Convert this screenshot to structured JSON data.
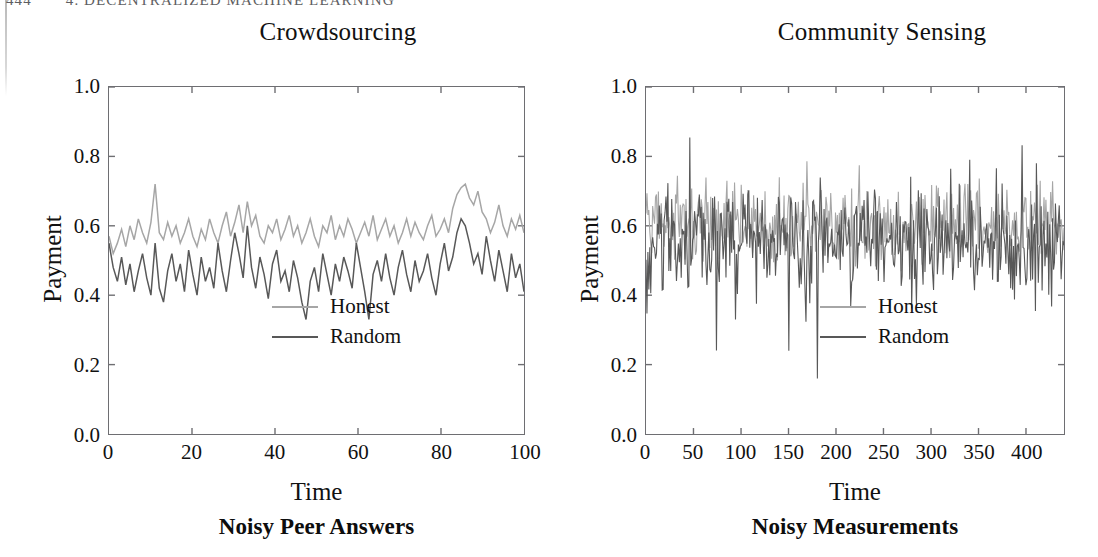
{
  "page": {
    "running_header": {
      "page_number": "444",
      "text": "4. DECENTRALIZED MACHINE LEARNING"
    }
  },
  "colors": {
    "honest": "#a6a6a6",
    "random": "#585858",
    "axis": "#6e6e72",
    "text": "#111111",
    "header": "#5e5e62"
  },
  "panels": [
    {
      "title": "Crowdsourcing",
      "caption": "Noisy Peer Answers",
      "legend": [
        {
          "label": "Honest",
          "color": "#a6a6a6"
        },
        {
          "label": "Random",
          "color": "#585858"
        }
      ]
    },
    {
      "title": "Community Sensing",
      "caption": "Noisy Measurements",
      "legend": [
        {
          "label": "Honest",
          "color": "#a6a6a6"
        },
        {
          "label": "Random",
          "color": "#585858"
        }
      ]
    }
  ],
  "chart_data": [
    {
      "type": "line",
      "title": "Crowdsourcing",
      "caption": "Noisy Peer Answers",
      "xlabel": "Time",
      "ylabel": "Payment",
      "xlim": [
        0,
        100
      ],
      "ylim": [
        0.0,
        1.0
      ],
      "xticks": [
        0,
        20,
        40,
        60,
        80,
        100
      ],
      "xtick_labels": [
        "0",
        "20",
        "40",
        "60",
        "80",
        "100"
      ],
      "yticks": [
        0.0,
        0.2,
        0.4,
        0.6,
        0.8,
        1.0
      ],
      "ytick_labels": [
        "0.0",
        "0.2",
        "0.4",
        "0.6",
        "0.8",
        "1.0"
      ],
      "grid": false,
      "legend_position": "lower right",
      "n_points": 100,
      "series": [
        {
          "name": "Honest",
          "color": "#a6a6a6",
          "mean": 0.575,
          "std": 0.055,
          "values": [
            0.57,
            0.52,
            0.55,
            0.59,
            0.54,
            0.6,
            0.56,
            0.62,
            0.58,
            0.55,
            0.61,
            0.72,
            0.58,
            0.56,
            0.61,
            0.57,
            0.6,
            0.55,
            0.58,
            0.62,
            0.57,
            0.54,
            0.59,
            0.56,
            0.62,
            0.58,
            0.55,
            0.6,
            0.64,
            0.57,
            0.61,
            0.66,
            0.58,
            0.67,
            0.6,
            0.63,
            0.57,
            0.55,
            0.6,
            0.58,
            0.62,
            0.56,
            0.59,
            0.63,
            0.57,
            0.6,
            0.55,
            0.58,
            0.62,
            0.57,
            0.54,
            0.6,
            0.58,
            0.63,
            0.56,
            0.6,
            0.57,
            0.62,
            0.59,
            0.55,
            0.58,
            0.61,
            0.57,
            0.63,
            0.56,
            0.59,
            0.62,
            0.57,
            0.6,
            0.55,
            0.58,
            0.62,
            0.57,
            0.61,
            0.58,
            0.56,
            0.6,
            0.63,
            0.57,
            0.59,
            0.62,
            0.58,
            0.65,
            0.69,
            0.71,
            0.72,
            0.68,
            0.66,
            0.7,
            0.64,
            0.62,
            0.58,
            0.61,
            0.66,
            0.6,
            0.57,
            0.62,
            0.59,
            0.63,
            0.58
          ]
        },
        {
          "name": "Random",
          "color": "#585858",
          "mean": 0.49,
          "std": 0.075,
          "values": [
            0.55,
            0.48,
            0.44,
            0.51,
            0.43,
            0.49,
            0.41,
            0.47,
            0.52,
            0.45,
            0.4,
            0.55,
            0.42,
            0.38,
            0.47,
            0.52,
            0.44,
            0.49,
            0.41,
            0.53,
            0.46,
            0.4,
            0.51,
            0.44,
            0.48,
            0.42,
            0.55,
            0.47,
            0.41,
            0.5,
            0.58,
            0.52,
            0.45,
            0.6,
            0.48,
            0.42,
            0.51,
            0.46,
            0.39,
            0.49,
            0.53,
            0.44,
            0.47,
            0.41,
            0.5,
            0.45,
            0.38,
            0.33,
            0.44,
            0.48,
            0.41,
            0.52,
            0.46,
            0.4,
            0.49,
            0.44,
            0.51,
            0.47,
            0.42,
            0.55,
            0.48,
            0.41,
            0.33,
            0.46,
            0.5,
            0.44,
            0.52,
            0.45,
            0.4,
            0.48,
            0.53,
            0.46,
            0.41,
            0.5,
            0.44,
            0.47,
            0.52,
            0.45,
            0.4,
            0.49,
            0.55,
            0.47,
            0.51,
            0.58,
            0.62,
            0.6,
            0.55,
            0.49,
            0.52,
            0.46,
            0.57,
            0.5,
            0.44,
            0.53,
            0.47,
            0.41,
            0.52,
            0.45,
            0.49,
            0.41
          ]
        }
      ]
    },
    {
      "type": "line",
      "title": "Community Sensing",
      "caption": "Noisy Measurements",
      "xlabel": "Time",
      "ylabel": "Payment",
      "xlim": [
        0,
        440
      ],
      "ylim": [
        0.0,
        1.0
      ],
      "xticks": [
        0,
        50,
        100,
        150,
        200,
        250,
        300,
        350,
        400
      ],
      "xtick_labels": [
        "0",
        "50",
        "100",
        "150",
        "200",
        "250",
        "300",
        "350",
        "400"
      ],
      "yticks": [
        0.0,
        0.2,
        0.4,
        0.6,
        0.8,
        1.0
      ],
      "ytick_labels": [
        "0.0",
        "0.2",
        "0.4",
        "0.6",
        "0.8",
        "1.0"
      ],
      "grid": false,
      "legend_position": "lower right",
      "n_points": 440,
      "series": [
        {
          "name": "Honest",
          "color": "#a6a6a6",
          "mean": 0.6,
          "std": 0.06,
          "note": "dense oscillation mostly between 0.47 and 0.72"
        },
        {
          "name": "Random",
          "color": "#585858",
          "mean": 0.55,
          "std": 0.085,
          "note": "dense oscillation mostly between 0.40 and 0.70; deep spikes to 0.24 near t=150 and 0.16 near t=180; high spike to 0.79 near t=340"
        }
      ]
    }
  ]
}
